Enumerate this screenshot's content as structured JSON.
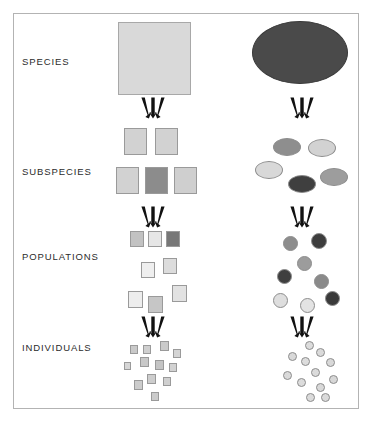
{
  "figure": {
    "type": "diagram",
    "background": "#ffffff",
    "frame_color": "#b3b3b3",
    "arrow_color": "#111111",
    "columns": [
      {
        "id": "squares",
        "shape": "square",
        "center_x": 154
      },
      {
        "id": "circles",
        "shape": "circle",
        "center_x": 300
      }
    ],
    "levels": [
      {
        "label": "SPECIES",
        "label_x": 22,
        "label_y": 56
      },
      {
        "label": "SUBSPECIES",
        "label_x": 22,
        "label_y": 166
      },
      {
        "label": "POPULATIONS",
        "label_x": 22,
        "label_y": 251
      },
      {
        "label": "INDIVIDUALS",
        "label_x": 22,
        "label_y": 342
      }
    ],
    "arrow_groups": [
      {
        "name": "species-to-subspecies-left",
        "x": 136,
        "y": 97
      },
      {
        "name": "species-to-subspecies-right",
        "x": 285,
        "y": 97
      },
      {
        "name": "subspecies-to-populations-left",
        "x": 136,
        "y": 206
      },
      {
        "name": "subspecies-to-populations-right",
        "x": 285,
        "y": 206
      },
      {
        "name": "populations-to-individuals-left",
        "x": 136,
        "y": 316
      },
      {
        "name": "populations-to-individuals-right",
        "x": 285,
        "y": 316
      }
    ],
    "shapes": {
      "species_square": {
        "x": 118,
        "y": 22,
        "w": 73,
        "h": 73,
        "fill": "#d9d9d9"
      },
      "species_ellipse": {
        "x": 252,
        "y": 21,
        "w": 96,
        "h": 63,
        "fill": "#4a4a4a"
      },
      "subspecies_squares": [
        {
          "x": 124,
          "y": 128,
          "w": 23,
          "h": 27,
          "fill": "#d2d2d2"
        },
        {
          "x": 155,
          "y": 128,
          "w": 23,
          "h": 27,
          "fill": "#d2d2d2"
        },
        {
          "x": 116,
          "y": 167,
          "w": 23,
          "h": 27,
          "fill": "#d2d2d2"
        },
        {
          "x": 145,
          "y": 167,
          "w": 23,
          "h": 27,
          "fill": "#8c8c8c"
        },
        {
          "x": 174,
          "y": 167,
          "w": 23,
          "h": 27,
          "fill": "#cfcfcf"
        }
      ],
      "subspecies_ellipses": [
        {
          "x": 273,
          "y": 138,
          "w": 28,
          "h": 18,
          "fill": "#8e8e8e"
        },
        {
          "x": 308,
          "y": 139,
          "w": 28,
          "h": 18,
          "fill": "#d2d2d2"
        },
        {
          "x": 255,
          "y": 161,
          "w": 28,
          "h": 18,
          "fill": "#d8d8d8"
        },
        {
          "x": 288,
          "y": 175,
          "w": 28,
          "h": 18,
          "fill": "#3f3f3f"
        },
        {
          "x": 320,
          "y": 168,
          "w": 28,
          "h": 18,
          "fill": "#9d9d9d"
        }
      ],
      "population_squares": [
        {
          "x": 130,
          "y": 231,
          "w": 14,
          "h": 16,
          "fill": "#c2c2c2"
        },
        {
          "x": 148,
          "y": 231,
          "w": 14,
          "h": 16,
          "fill": "#e6e6e6"
        },
        {
          "x": 166,
          "y": 231,
          "w": 14,
          "h": 16,
          "fill": "#777777"
        },
        {
          "x": 141,
          "y": 262,
          "w": 14,
          "h": 16,
          "fill": "#efefef"
        },
        {
          "x": 163,
          "y": 258,
          "w": 14,
          "h": 16,
          "fill": "#dcdcdc"
        },
        {
          "x": 128,
          "y": 291,
          "w": 15,
          "h": 17,
          "fill": "#ededed"
        },
        {
          "x": 148,
          "y": 296,
          "w": 15,
          "h": 17,
          "fill": "#c6c6c6"
        },
        {
          "x": 172,
          "y": 285,
          "w": 15,
          "h": 17,
          "fill": "#e2e2e2"
        }
      ],
      "population_circles": [
        {
          "x": 283,
          "y": 236,
          "w": 15,
          "h": 15,
          "fill": "#8d8d8d"
        },
        {
          "x": 311,
          "y": 233,
          "w": 16,
          "h": 16,
          "fill": "#3d3d3d"
        },
        {
          "x": 297,
          "y": 256,
          "w": 15,
          "h": 15,
          "fill": "#9c9c9c"
        },
        {
          "x": 277,
          "y": 269,
          "w": 15,
          "h": 15,
          "fill": "#3f3f3f"
        },
        {
          "x": 314,
          "y": 274,
          "w": 15,
          "h": 15,
          "fill": "#8a8a8a"
        },
        {
          "x": 273,
          "y": 293,
          "w": 15,
          "h": 15,
          "fill": "#dedede"
        },
        {
          "x": 300,
          "y": 298,
          "w": 15,
          "h": 15,
          "fill": "#e3e3e3"
        },
        {
          "x": 325,
          "y": 291,
          "w": 15,
          "h": 15,
          "fill": "#3a3a3a"
        }
      ],
      "individual_squares": [
        {
          "x": 130,
          "y": 345,
          "w": 8,
          "h": 9,
          "fill": "#c9c9c9"
        },
        {
          "x": 143,
          "y": 345,
          "w": 8,
          "h": 9,
          "fill": "#cfcfcf"
        },
        {
          "x": 160,
          "y": 341,
          "w": 9,
          "h": 10,
          "fill": "#cacaca"
        },
        {
          "x": 173,
          "y": 349,
          "w": 8,
          "h": 9,
          "fill": "#d4d4d4"
        },
        {
          "x": 124,
          "y": 362,
          "w": 7,
          "h": 8,
          "fill": "#d6d6d6"
        },
        {
          "x": 140,
          "y": 357,
          "w": 9,
          "h": 10,
          "fill": "#c8c8c8"
        },
        {
          "x": 155,
          "y": 360,
          "w": 9,
          "h": 10,
          "fill": "#c4c4c4"
        },
        {
          "x": 169,
          "y": 363,
          "w": 8,
          "h": 9,
          "fill": "#d2d2d2"
        },
        {
          "x": 147,
          "y": 374,
          "w": 9,
          "h": 10,
          "fill": "#cdcdcd"
        },
        {
          "x": 134,
          "y": 380,
          "w": 9,
          "h": 10,
          "fill": "#cccccc"
        },
        {
          "x": 163,
          "y": 377,
          "w": 8,
          "h": 9,
          "fill": "#d0d0d0"
        },
        {
          "x": 151,
          "y": 392,
          "w": 8,
          "h": 9,
          "fill": "#cbcbcb"
        }
      ],
      "individual_circles": [
        {
          "x": 305,
          "y": 341,
          "w": 9,
          "h": 9,
          "fill": "#dcdcdc"
        },
        {
          "x": 316,
          "y": 348,
          "w": 9,
          "h": 9,
          "fill": "#dadada"
        },
        {
          "x": 288,
          "y": 352,
          "w": 9,
          "h": 9,
          "fill": "#d9d9d9"
        },
        {
          "x": 301,
          "y": 357,
          "w": 9,
          "h": 9,
          "fill": "#dddddd"
        },
        {
          "x": 326,
          "y": 358,
          "w": 9,
          "h": 9,
          "fill": "#d8d8d8"
        },
        {
          "x": 311,
          "y": 368,
          "w": 9,
          "h": 9,
          "fill": "#dbdbdb"
        },
        {
          "x": 283,
          "y": 371,
          "w": 9,
          "h": 9,
          "fill": "#dadada"
        },
        {
          "x": 297,
          "y": 378,
          "w": 9,
          "h": 9,
          "fill": "#dcdcdc"
        },
        {
          "x": 329,
          "y": 375,
          "w": 9,
          "h": 9,
          "fill": "#d7d7d7"
        },
        {
          "x": 316,
          "y": 383,
          "w": 9,
          "h": 9,
          "fill": "#d9d9d9"
        },
        {
          "x": 306,
          "y": 393,
          "w": 9,
          "h": 9,
          "fill": "#dbdbdb"
        },
        {
          "x": 321,
          "y": 393,
          "w": 9,
          "h": 9,
          "fill": "#dadada"
        }
      ]
    }
  }
}
